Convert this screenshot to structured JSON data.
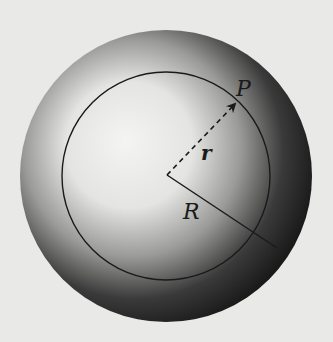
{
  "diagram": {
    "labels": {
      "point": "P",
      "inner_radius": "r",
      "outer_radius": "R"
    },
    "colors": {
      "background": "#e9e9e7",
      "sphere_dark": "#1e1e1e",
      "sphere_light": "#f2f2f0",
      "line": "#1a1a1a"
    }
  }
}
